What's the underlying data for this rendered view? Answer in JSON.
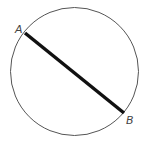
{
  "diagram": {
    "type": "circle-chord",
    "circle": {
      "cx": 74.5,
      "cy": 71.5,
      "r": 64,
      "stroke": "#555555",
      "stroke_width": 1
    },
    "chord": {
      "x1": 25,
      "y1": 33,
      "x2": 124,
      "y2": 113,
      "stroke": "#111111",
      "stroke_width": 3.5
    },
    "points": [
      {
        "label": "A",
        "x": 25,
        "y": 33,
        "label_x": 15,
        "label_y": 33
      },
      {
        "label": "B",
        "x": 124,
        "y": 113,
        "label_x": 126,
        "label_y": 124
      }
    ]
  }
}
